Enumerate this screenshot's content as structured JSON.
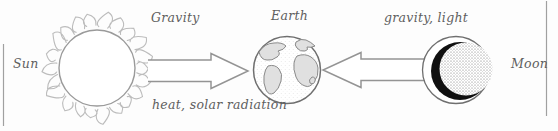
{
  "diagram": {
    "type": "physics-system-diagram",
    "labels": {
      "sun": "Sun",
      "earth": "Earth",
      "moon": "Moon",
      "sun_to_earth_top": "Gravity",
      "sun_to_earth_bottom": "heat, solar radiation",
      "moon_to_earth": "gravity, light"
    },
    "nodes": [
      {
        "id": "sun",
        "label": "Sun",
        "style": "circle-with-flame-corona"
      },
      {
        "id": "earth",
        "label": "Earth",
        "style": "globe-with-continents"
      },
      {
        "id": "moon",
        "label": "Moon",
        "style": "stippled-disc-with-dark-crescent"
      }
    ],
    "edges": [
      {
        "from": "sun",
        "to": "earth",
        "direction": "right",
        "labels": [
          "Gravity",
          "heat, solar radiation"
        ],
        "style": "hollow-open-tail-arrow"
      },
      {
        "from": "moon",
        "to": "earth",
        "direction": "left",
        "labels": [
          "gravity, light"
        ],
        "style": "hollow-open-tail-arrow"
      }
    ],
    "colors": {
      "line": "#999999",
      "sun_outline": "#9a9a9a",
      "corona": "#bcbcbc",
      "earth_outline": "#6f6f6f",
      "continent_fill": "#e0e0e0",
      "moon_shadow": "#101010",
      "text": "#5f5f5f",
      "frame_line": "#a0a0a0"
    }
  }
}
